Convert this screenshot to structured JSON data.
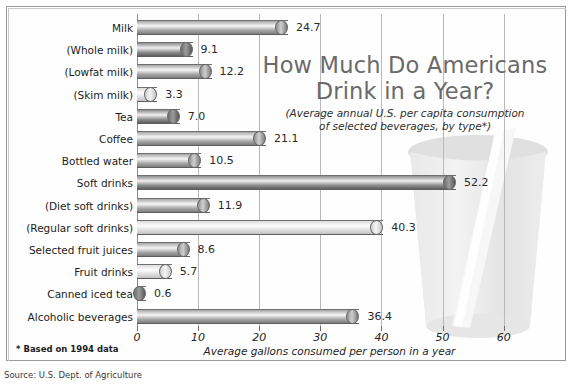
{
  "title": {
    "line1": "How Much Do Americans",
    "line2": "Drink in a Year?",
    "subtitle_line1": "(Average annual U.S. per capita consumption",
    "subtitle_line2": "of selected beverages, by type*)"
  },
  "footnote": "* Based on 1994 data",
  "source": "Source: U.S. Dept. of Agriculture",
  "colors": {
    "bar_dark": "#6f6f6f",
    "bar_mid": "#a9a9a9",
    "bar_light": "#d8d8d8",
    "grid": "#b9b9b9",
    "title": "#6a6a6a",
    "text": "#1c1c1c"
  },
  "chart_data": {
    "type": "bar",
    "orientation": "horizontal",
    "title": "How Much Do Americans Drink in a Year?",
    "subtitle": "(Average annual U.S. per capita consumption of selected beverages, by type*)",
    "xlabel": "Average gallons consumed per person in a year",
    "ylabel": "",
    "xlim": [
      0,
      63
    ],
    "xticks": [
      0,
      10,
      20,
      30,
      40,
      50,
      60
    ],
    "xticklabels": [
      "0",
      "10",
      "20",
      "30",
      "40",
      "50",
      "60"
    ],
    "grid": true,
    "legend": false,
    "units": "gallons per person per year",
    "categories": [
      "Milk",
      "(Whole milk)",
      "(Lowfat milk)",
      "(Skim milk)",
      "Tea",
      "Coffee",
      "Bottled water",
      "Soft drinks",
      "(Diet soft drinks)",
      "(Regular soft drinks)",
      "Selected fruit juices",
      "Fruit drinks",
      "Canned iced tea",
      "Alcoholic beverages"
    ],
    "values": [
      24.7,
      9.1,
      12.2,
      3.3,
      7.0,
      21.1,
      10.5,
      52.2,
      11.9,
      40.3,
      8.6,
      5.7,
      0.6,
      36.4
    ],
    "value_labels": [
      "24.7",
      "9.1",
      "12.2",
      "3.3",
      "7.0",
      "21.1",
      "10.5",
      "52.2",
      "11.9",
      "40.3",
      "8.6",
      "5.7",
      "0.6",
      "36.4"
    ],
    "bar_shades": [
      "mid",
      "dark",
      "mid",
      "light",
      "dark",
      "mid",
      "mid",
      "dark",
      "mid",
      "light",
      "mid",
      "light",
      "dark",
      "mid"
    ]
  }
}
